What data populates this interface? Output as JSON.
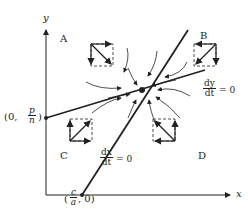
{
  "axes": {
    "x_label": "x",
    "y_label": "y"
  },
  "regions": [
    "A",
    "B",
    "C",
    "D"
  ],
  "nullclines": {
    "dy": {
      "num": "dy",
      "den": "dt",
      "eq": "= 0"
    },
    "dx": {
      "num": "dx",
      "den": "dt",
      "eq": "= 0"
    }
  },
  "intercepts": {
    "y": {
      "prefix": "(0,",
      "num": "p",
      "den": "n",
      "suffix": ")"
    },
    "x": {
      "prefix": "(",
      "num": "c",
      "den": "a",
      "suffix": ", 0)"
    }
  }
}
